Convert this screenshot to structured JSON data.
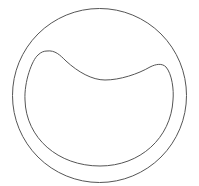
{
  "diagram": {
    "caption": "",
    "stroke_color": "#555555",
    "background": "#ffffff",
    "outer_ring": {
      "shape": "circle",
      "cx": 99.5,
      "cy": 95.5,
      "r": 87
    },
    "inner_shape": {
      "shape": "crescent-bowl",
      "description": "rounded bowl with two raised lobes at top and a dip between them"
    }
  }
}
